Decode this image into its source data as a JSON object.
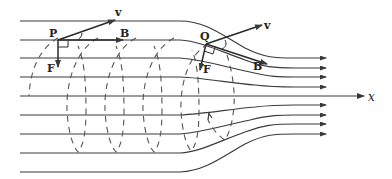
{
  "diagram": {
    "title": "",
    "colors": {
      "line": "#3a3a3a",
      "dashed": "#555555",
      "background": "#ffffff"
    },
    "labels": {
      "point_p": "P",
      "point_q": "Q",
      "v_at_p": "v",
      "b_at_p": "B",
      "f_at_p": "F",
      "v_at_q": "v",
      "b_at_q": "B",
      "f_at_q": "F",
      "axis_x": "x"
    },
    "field_lines": {
      "count_above_axis": 4,
      "count_below_axis": 4,
      "left_spacing_px": 19,
      "right_spacing_px": 9.5
    },
    "helix_loops": 5
  }
}
